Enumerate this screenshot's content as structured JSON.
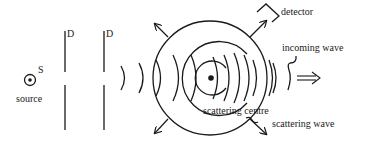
{
  "diagram": {
    "type": "scattering-experiment",
    "labels": {
      "source_symbol": "S",
      "source": "source",
      "barrier_1": "D",
      "barrier_2": "D",
      "detector": "detector",
      "incoming_wave": "incoming wave",
      "scattering_centre": "scattering centre",
      "scattering_wave": "scattering wave"
    },
    "icons": {
      "source": "circled-dot",
      "scattering_centre": "filled-dot",
      "direction": "double-arrow-right",
      "detector": "bracket-detector"
    },
    "colors": {
      "ink": "#1a1a1a",
      "background": "#ffffff"
    }
  }
}
